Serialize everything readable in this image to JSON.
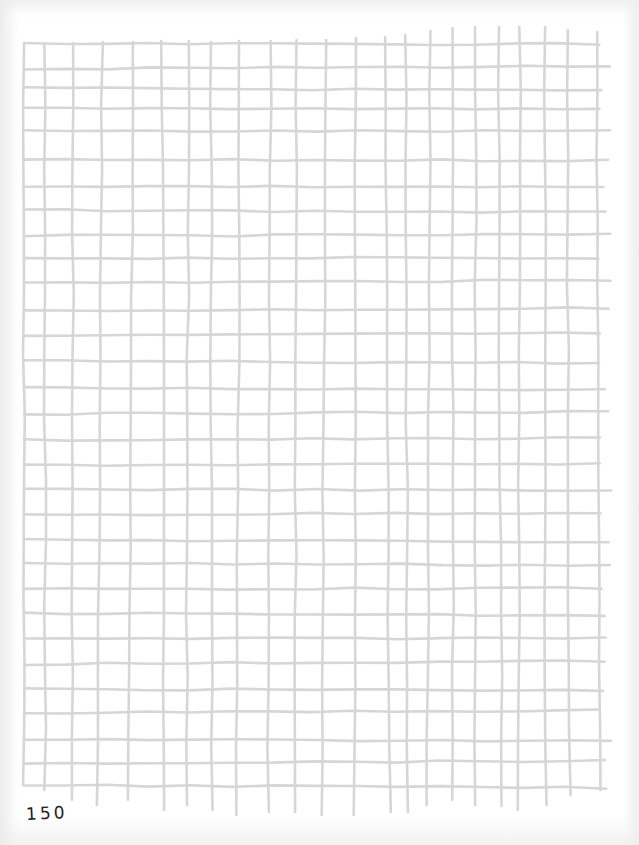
{
  "page": {
    "page_number": "150",
    "line_color": "#d6d6d6",
    "paper_color": "#ffffff"
  },
  "grid": {
    "vertical_lines": [
      {
        "top": 44,
        "bottom": 785
      },
      {
        "top": 45,
        "bottom": 790
      },
      {
        "top": 43,
        "bottom": 800
      },
      {
        "top": 42,
        "bottom": 805
      },
      {
        "top": 42,
        "bottom": 800
      },
      {
        "top": 41,
        "bottom": 810
      },
      {
        "top": 41,
        "bottom": 805
      },
      {
        "top": 42,
        "bottom": 810
      },
      {
        "top": 41,
        "bottom": 815
      },
      {
        "top": 41,
        "bottom": 812
      },
      {
        "top": 40,
        "bottom": 812
      },
      {
        "top": 40,
        "bottom": 815
      },
      {
        "top": 38,
        "bottom": 815
      },
      {
        "top": 37,
        "bottom": 812
      },
      {
        "top": 35,
        "bottom": 812
      },
      {
        "top": 31,
        "bottom": 805
      },
      {
        "top": 28,
        "bottom": 800
      },
      {
        "top": 27,
        "bottom": 805
      },
      {
        "top": 27,
        "bottom": 806
      },
      {
        "top": 27,
        "bottom": 810
      },
      {
        "top": 27,
        "bottom": 805
      },
      {
        "top": 30,
        "bottom": 795
      },
      {
        "top": 32,
        "bottom": 790
      }
    ],
    "vertical_x": [
      24,
      45,
      73,
      102,
      133,
      162,
      189,
      211,
      240,
      271,
      296,
      326,
      355,
      385,
      406,
      430,
      453,
      476,
      498,
      520,
      545,
      567,
      597
    ],
    "horizontal_y": [
      44,
      69,
      88,
      108,
      131,
      160,
      186,
      210,
      236,
      258,
      283,
      311,
      336,
      361,
      388,
      414,
      440,
      465,
      489,
      515,
      540,
      563,
      589,
      613,
      639,
      664,
      689,
      713,
      739,
      763,
      785
    ],
    "left_x": 24,
    "right_x": 605
  }
}
